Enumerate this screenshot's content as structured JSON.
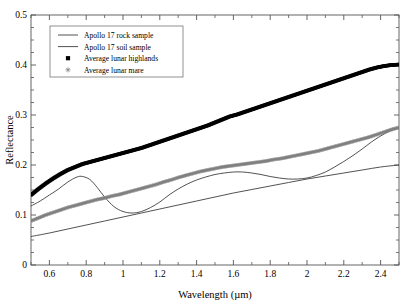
{
  "chart_data": {
    "type": "line",
    "title": "",
    "xlabel": "Wavelength (µm)",
    "ylabel": "Reflectance",
    "xlim": [
      0.5,
      2.5
    ],
    "ylim": [
      0.0,
      0.5
    ],
    "xticks": [
      0.6,
      0.8,
      1.0,
      1.2,
      1.4,
      1.6,
      1.8,
      2.0,
      2.2,
      2.4
    ],
    "xtick_labels": [
      "0.6",
      "0.8",
      "1",
      "1.2",
      "1.4",
      "1.6",
      "1.8",
      "2",
      "2.2",
      "2.4"
    ],
    "yticks": [
      0.0,
      0.1,
      0.2,
      0.3,
      0.4,
      0.5
    ],
    "ytick_labels": [
      "0",
      "0.1",
      "0.2",
      "0.3",
      "0.4",
      "0.5"
    ],
    "grid": false,
    "minor_ticks": true,
    "tick_direction": "in",
    "frame": "box",
    "legend_position": "upper-left",
    "series": [
      {
        "name": "Apollo 17 rock sample",
        "label": "Apollo 17 rock sample",
        "style": "line",
        "color": "#333333",
        "marker": "none",
        "x": [
          0.5,
          0.55,
          0.6,
          0.65,
          0.7,
          0.75,
          0.78,
          0.82,
          0.86,
          0.9,
          0.95,
          1.0,
          1.05,
          1.1,
          1.15,
          1.2,
          1.25,
          1.3,
          1.35,
          1.4,
          1.45,
          1.5,
          1.55,
          1.6,
          1.65,
          1.7,
          1.75,
          1.8,
          1.85,
          1.9,
          1.95,
          2.0,
          2.05,
          2.1,
          2.15,
          2.2,
          2.25,
          2.3,
          2.35,
          2.4,
          2.45,
          2.5
        ],
        "y": [
          0.118,
          0.128,
          0.14,
          0.152,
          0.166,
          0.176,
          0.177,
          0.171,
          0.155,
          0.136,
          0.117,
          0.107,
          0.104,
          0.107,
          0.115,
          0.126,
          0.14,
          0.152,
          0.162,
          0.17,
          0.176,
          0.181,
          0.184,
          0.186,
          0.186,
          0.184,
          0.181,
          0.177,
          0.174,
          0.172,
          0.172,
          0.174,
          0.179,
          0.186,
          0.196,
          0.207,
          0.219,
          0.232,
          0.246,
          0.258,
          0.268,
          0.275
        ]
      },
      {
        "name": "Apollo 17 soil sample",
        "label": "Apollo 17 soil sample",
        "style": "line",
        "color": "#333333",
        "marker": "none",
        "x": [
          0.5,
          0.6,
          0.7,
          0.8,
          0.9,
          1.0,
          1.1,
          1.2,
          1.3,
          1.4,
          1.5,
          1.6,
          1.7,
          1.8,
          1.9,
          2.0,
          2.1,
          2.2,
          2.3,
          2.4,
          2.5
        ],
        "y": [
          0.057,
          0.064,
          0.072,
          0.08,
          0.088,
          0.096,
          0.104,
          0.112,
          0.12,
          0.128,
          0.136,
          0.144,
          0.151,
          0.158,
          0.165,
          0.172,
          0.178,
          0.184,
          0.19,
          0.196,
          0.2
        ]
      },
      {
        "name": "Average lunar highlands",
        "label": "Average lunar highlands",
        "style": "markers",
        "color": "#000000",
        "marker": "filled-square",
        "x": [
          0.5,
          0.54,
          0.58,
          0.62,
          0.66,
          0.7,
          0.74,
          0.78,
          0.82,
          0.86,
          0.9,
          0.94,
          0.98,
          1.02,
          1.06,
          1.1,
          1.14,
          1.18,
          1.22,
          1.26,
          1.3,
          1.34,
          1.38,
          1.42,
          1.46,
          1.5,
          1.54,
          1.58,
          1.62,
          1.66,
          1.7,
          1.74,
          1.78,
          1.82,
          1.86,
          1.9,
          1.94,
          1.98,
          2.02,
          2.06,
          2.1,
          2.14,
          2.18,
          2.22,
          2.26,
          2.3,
          2.34,
          2.38,
          2.42,
          2.46,
          2.5
        ],
        "y": [
          0.14,
          0.152,
          0.163,
          0.173,
          0.182,
          0.19,
          0.196,
          0.202,
          0.206,
          0.21,
          0.214,
          0.218,
          0.222,
          0.226,
          0.23,
          0.234,
          0.239,
          0.244,
          0.249,
          0.254,
          0.259,
          0.264,
          0.269,
          0.274,
          0.279,
          0.285,
          0.291,
          0.297,
          0.301,
          0.306,
          0.311,
          0.316,
          0.321,
          0.326,
          0.331,
          0.336,
          0.341,
          0.346,
          0.351,
          0.356,
          0.361,
          0.366,
          0.371,
          0.376,
          0.381,
          0.386,
          0.391,
          0.395,
          0.398,
          0.4,
          0.401
        ]
      },
      {
        "name": "Average lunar mare",
        "label": "Average lunar mare",
        "style": "markers",
        "color": "#808080",
        "marker": "asterisk",
        "x": [
          0.5,
          0.54,
          0.58,
          0.62,
          0.66,
          0.7,
          0.74,
          0.78,
          0.82,
          0.86,
          0.9,
          0.94,
          0.98,
          1.02,
          1.06,
          1.1,
          1.14,
          1.18,
          1.22,
          1.26,
          1.3,
          1.34,
          1.38,
          1.42,
          1.46,
          1.5,
          1.54,
          1.58,
          1.62,
          1.66,
          1.7,
          1.74,
          1.78,
          1.82,
          1.86,
          1.9,
          1.94,
          1.98,
          2.02,
          2.06,
          2.1,
          2.14,
          2.18,
          2.22,
          2.26,
          2.3,
          2.34,
          2.38,
          2.42,
          2.46,
          2.5
        ],
        "y": [
          0.088,
          0.094,
          0.1,
          0.105,
          0.11,
          0.115,
          0.119,
          0.123,
          0.127,
          0.131,
          0.134,
          0.138,
          0.141,
          0.145,
          0.149,
          0.153,
          0.157,
          0.161,
          0.166,
          0.17,
          0.175,
          0.179,
          0.183,
          0.187,
          0.19,
          0.193,
          0.196,
          0.198,
          0.2,
          0.202,
          0.204,
          0.206,
          0.208,
          0.211,
          0.213,
          0.216,
          0.219,
          0.222,
          0.225,
          0.228,
          0.232,
          0.236,
          0.24,
          0.244,
          0.248,
          0.252,
          0.256,
          0.261,
          0.266,
          0.271,
          0.275
        ]
      }
    ]
  }
}
